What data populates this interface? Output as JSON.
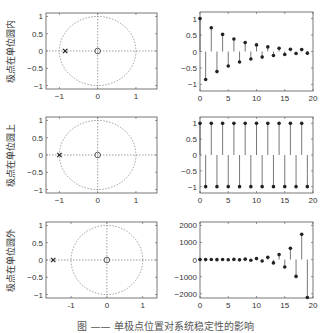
{
  "caption": "图 —— 单极点位置对系统稳定性的影响",
  "chart_data": [
    {
      "type": "scatter",
      "subtype": "pole-zero",
      "ylabel": "极点在单位圆内",
      "xlim": [
        -1.35,
        1.55
      ],
      "ylim": [
        -1.1,
        1.1
      ],
      "xticks": [
        -1,
        0,
        1
      ],
      "yticks": [
        -1,
        -0.5,
        0,
        0.5,
        1
      ],
      "ytick_labels": [
        "−1",
        "−0.5",
        "0",
        "0.5",
        "1"
      ],
      "xtick_labels": [
        "−1",
        "0",
        "1"
      ],
      "unit_circle": true,
      "poles": [
        [
          -0.85,
          0
        ]
      ],
      "zeros": [
        [
          0,
          0
        ]
      ]
    },
    {
      "type": "stem",
      "xlim": [
        0,
        20
      ],
      "ylim": [
        -1.2,
        1.2
      ],
      "xticks": [
        0,
        5,
        10,
        15,
        20
      ],
      "yticks": [
        -1,
        -0.5,
        0,
        0.5,
        1
      ],
      "ytick_labels": [
        "−1",
        "−0.5",
        "0",
        "0.5",
        "1"
      ],
      "xtick_labels": [
        "0",
        "5",
        "10",
        "15",
        "20"
      ],
      "x": [
        0,
        1,
        2,
        3,
        4,
        5,
        6,
        7,
        8,
        9,
        10,
        11,
        12,
        13,
        14,
        15,
        16,
        17,
        18,
        19
      ],
      "values": [
        1,
        -0.85,
        0.72,
        -0.61,
        0.52,
        -0.44,
        0.38,
        -0.32,
        0.27,
        -0.23,
        0.2,
        -0.17,
        0.14,
        -0.12,
        0.1,
        -0.09,
        0.07,
        -0.06,
        0.06,
        -0.05
      ]
    },
    {
      "type": "scatter",
      "subtype": "pole-zero",
      "ylabel": "极点在单位圆上",
      "xlim": [
        -1.35,
        1.55
      ],
      "ylim": [
        -1.1,
        1.1
      ],
      "xticks": [
        -1,
        0,
        1
      ],
      "yticks": [
        -1,
        -0.5,
        0,
        0.5,
        1
      ],
      "ytick_labels": [
        "−1",
        "−0.5",
        "0",
        "0.5",
        "1"
      ],
      "xtick_labels": [
        "−1",
        "0",
        "1"
      ],
      "unit_circle": true,
      "poles": [
        [
          -1,
          0
        ]
      ],
      "zeros": [
        [
          0,
          0
        ]
      ]
    },
    {
      "type": "stem",
      "xlim": [
        0,
        20
      ],
      "ylim": [
        -1.2,
        1.2
      ],
      "xticks": [
        0,
        5,
        10,
        15,
        20
      ],
      "yticks": [
        -1,
        -0.5,
        0,
        0.5,
        1
      ],
      "ytick_labels": [
        "−1",
        "−0.5",
        "0",
        "0.5",
        "1"
      ],
      "xtick_labels": [
        "0",
        "5",
        "10",
        "15",
        "20"
      ],
      "x": [
        0,
        1,
        2,
        3,
        4,
        5,
        6,
        7,
        8,
        9,
        10,
        11,
        12,
        13,
        14,
        15,
        16,
        17,
        18,
        19
      ],
      "values": [
        1,
        -1,
        1,
        -1,
        1,
        -1,
        1,
        -1,
        1,
        -1,
        1,
        -1,
        1,
        -1,
        1,
        -1,
        1,
        -1,
        1,
        -1
      ]
    },
    {
      "type": "scatter",
      "subtype": "pole-zero",
      "ylabel": "极点在单位圆外",
      "xlim": [
        -1.7,
        1.4
      ],
      "ylim": [
        -1.1,
        1.1
      ],
      "xticks": [
        -1,
        0,
        1
      ],
      "yticks": [
        -1,
        -0.5,
        0,
        0.5,
        1
      ],
      "ytick_labels": [
        "−1",
        "−0.5",
        "0",
        "0.5",
        "1"
      ],
      "xtick_labels": [
        "-1",
        "0",
        "1"
      ],
      "unit_circle": true,
      "poles": [
        [
          -1.5,
          0
        ]
      ],
      "zeros": [
        [
          0,
          0
        ]
      ]
    },
    {
      "type": "stem",
      "xlim": [
        0,
        20
      ],
      "ylim": [
        -2250,
        2200
      ],
      "xticks": [
        0,
        5,
        10,
        15,
        20
      ],
      "yticks": [
        -2000,
        -1000,
        0,
        1000,
        2000
      ],
      "ytick_labels": [
        "−2000",
        "−1000",
        "0",
        "1000",
        "2000"
      ],
      "xtick_labels": [
        "0",
        "5",
        "10",
        "15",
        "20"
      ],
      "x": [
        0,
        1,
        2,
        3,
        4,
        5,
        6,
        7,
        8,
        9,
        10,
        11,
        12,
        13,
        14,
        15,
        16,
        17,
        18,
        19
      ],
      "values": [
        1,
        -1.5,
        2.25,
        -3.4,
        5.1,
        -7.6,
        11.4,
        -17.1,
        25.6,
        -38.4,
        57.7,
        -86.5,
        129.7,
        -194.6,
        291.9,
        -437.9,
        656.8,
        -985.3,
        1477.9,
        -2216.8
      ]
    }
  ]
}
